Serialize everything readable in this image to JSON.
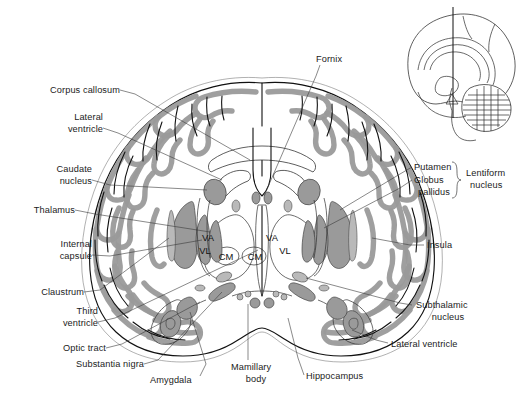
{
  "figure": {
    "width": 524,
    "height": 403,
    "background_color": "#ffffff",
    "gray_matter_color": "#9a9a9a",
    "outline_color": "#111111",
    "leader_color": "#3a3a3a"
  },
  "labels": {
    "left": [
      {
        "id": "corpus-callosum",
        "text": "Corpus callosum",
        "lines": [
          "Corpus callosum"
        ]
      },
      {
        "id": "lateral-ventricle-left",
        "text": "Lateral ventricle",
        "lines": [
          "Lateral",
          "ventricle"
        ]
      },
      {
        "id": "caudate-nucleus",
        "text": "Caudate nucleus",
        "lines": [
          "Caudate",
          "nucleus"
        ]
      },
      {
        "id": "thalamus",
        "text": "Thalamus",
        "lines": [
          "Thalamus"
        ]
      },
      {
        "id": "internal-capsule",
        "text": "Internal capsule",
        "lines": [
          "Internal",
          "capsule"
        ]
      },
      {
        "id": "claustrum",
        "text": "Claustrum",
        "lines": [
          "Claustrum"
        ]
      },
      {
        "id": "third-ventricle",
        "text": "Third ventricle",
        "lines": [
          "Third",
          "ventricle"
        ]
      },
      {
        "id": "optic-tract",
        "text": "Optic tract",
        "lines": [
          "Optic tract"
        ]
      },
      {
        "id": "substantia-nigra",
        "text": "Substantia nigra",
        "lines": [
          "Substantia nigra"
        ]
      },
      {
        "id": "amygdala",
        "text": "Amygdala",
        "lines": [
          "Amygdala"
        ]
      }
    ],
    "top": [
      {
        "id": "fornix",
        "text": "Fornix",
        "lines": [
          "Fornix"
        ]
      }
    ],
    "bottom": [
      {
        "id": "mamillary-body",
        "text": "Mamillary body",
        "lines": [
          "Mamillary",
          "body"
        ]
      },
      {
        "id": "hippocampus",
        "text": "Hippocampus",
        "lines": [
          "Hippocampus"
        ]
      }
    ],
    "right": [
      {
        "id": "putamen",
        "text": "Putamen",
        "lines": [
          "Putamen"
        ]
      },
      {
        "id": "globus-pallidus",
        "text": "Globus pallidus",
        "lines": [
          "Globus",
          "pallidus"
        ]
      },
      {
        "id": "lentiform-nucleus",
        "text": "Lentiform nucleus",
        "lines": [
          "Lentiform",
          "nucleus"
        ]
      },
      {
        "id": "insula",
        "text": "Insula",
        "lines": [
          "Insula"
        ]
      },
      {
        "id": "subthalamic-nucleus",
        "text": "Subthalamic nucleus",
        "lines": [
          "Subthalamic",
          "nucleus"
        ]
      },
      {
        "id": "lateral-ventricle-right",
        "text": "Lateral ventricle",
        "lines": [
          "Lateral ventricle"
        ]
      }
    ]
  },
  "thalamic_nuclei": {
    "description": "Abbreviated thalamic nuclei labelled inside each thalamus",
    "left_hemisphere": [
      {
        "id": "va-left",
        "abbr": "VA",
        "x": 208,
        "y": 238
      },
      {
        "id": "vl-left",
        "abbr": "VL",
        "x": 205,
        "y": 251
      },
      {
        "id": "cm-left",
        "abbr": "CM",
        "x": 225,
        "y": 258
      }
    ],
    "right_hemisphere": [
      {
        "id": "va-right",
        "abbr": "VA",
        "x": 272,
        "y": 238
      },
      {
        "id": "vl-right",
        "abbr": "VL",
        "x": 285,
        "y": 251
      },
      {
        "id": "cm-right",
        "abbr": "CM",
        "x": 256,
        "y": 258
      }
    ]
  },
  "inset": {
    "id": "sagittal-orientation-inset",
    "description": "Mid-sagittal brain showing the plane of section",
    "section_line_label": "plane of section"
  }
}
